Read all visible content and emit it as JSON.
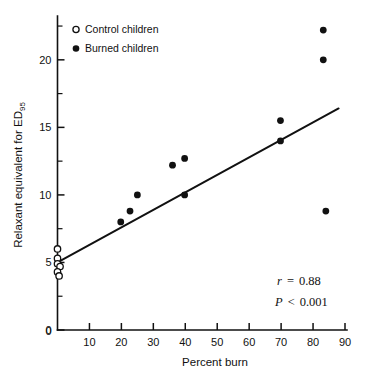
{
  "chart_data": {
    "type": "scatter",
    "title": "",
    "xlabel": "Percent burn",
    "ylabel": "Relaxant equivalent for ED95",
    "ylabel_base": "Relaxant equivalent for ED",
    "ylabel_subscript": "95",
    "xlim": [
      0,
      90
    ],
    "ylim": [
      0,
      22.8
    ],
    "xticks": [
      0,
      10,
      20,
      30,
      40,
      50,
      60,
      70,
      80,
      90
    ],
    "xtick_labels": [
      "0",
      "10",
      "20",
      "30",
      "40",
      "50",
      "60",
      "70",
      "80",
      "90"
    ],
    "yticks": [
      0,
      5,
      10,
      15,
      20
    ],
    "ytick_labels": [
      "0",
      "5",
      "10",
      "15",
      "20"
    ],
    "y_minor_ticks": [
      2.5,
      7.5,
      12.5,
      17.5,
      22.5
    ],
    "grid": false,
    "legend_position": "top-left",
    "series": [
      {
        "name": "Control children",
        "marker": "open-circle",
        "color": "#111111",
        "points": [
          {
            "x": 0,
            "y": 6.0
          },
          {
            "x": 0,
            "y": 5.3
          },
          {
            "x": 0,
            "y": 4.9
          },
          {
            "x": 0.8,
            "y": 4.7
          },
          {
            "x": 0,
            "y": 4.3
          },
          {
            "x": 0.5,
            "y": 4.0
          }
        ]
      },
      {
        "name": "Burned children",
        "marker": "filled-circle",
        "color": "#111111",
        "points": [
          {
            "x": 19.8,
            "y": 8.0
          },
          {
            "x": 22.7,
            "y": 8.8
          },
          {
            "x": 25.0,
            "y": 10.0
          },
          {
            "x": 36.0,
            "y": 12.2
          },
          {
            "x": 39.8,
            "y": 12.7
          },
          {
            "x": 39.8,
            "y": 10.0
          },
          {
            "x": 69.8,
            "y": 15.5
          },
          {
            "x": 69.8,
            "y": 14.0
          },
          {
            "x": 83.2,
            "y": 22.2
          },
          {
            "x": 83.2,
            "y": 20.0
          },
          {
            "x": 84.0,
            "y": 8.8
          }
        ]
      }
    ],
    "regression_line": {
      "x0": 0,
      "y0": 5.0,
      "x1": 88.0,
      "y1": 16.4
    },
    "annotations": [
      {
        "symbol": "r",
        "relation": "=",
        "value": "0.88"
      },
      {
        "symbol": "P",
        "relation": "<",
        "value": "0.001"
      }
    ]
  },
  "legend": {
    "items": [
      {
        "label": "Control children",
        "marker": "open-circle"
      },
      {
        "label": "Burned children",
        "marker": "filled-circle"
      }
    ]
  }
}
